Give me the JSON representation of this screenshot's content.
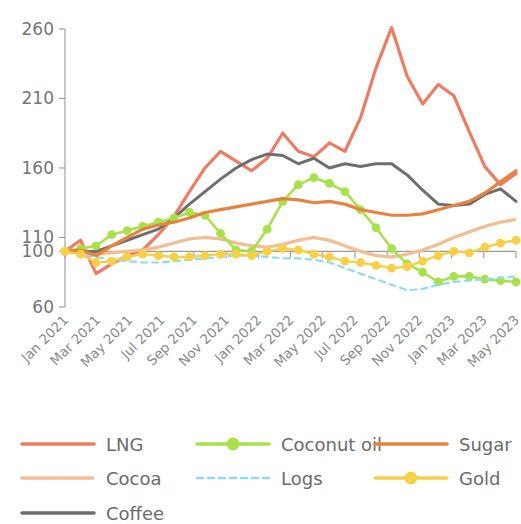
{
  "chart_data": {
    "type": "line",
    "title": "",
    "subtitle": "",
    "xlabel": "",
    "ylabel": "",
    "ylim": [
      60,
      265
    ],
    "ytick_values": [
      60,
      100,
      110,
      160,
      210,
      260
    ],
    "ytick_labels": [
      "60",
      "100",
      "110",
      "160",
      "210",
      "260"
    ],
    "grid": false,
    "legend_position": "bottom",
    "baseline": 100,
    "x": [
      "Jan 2021",
      "Feb 2021",
      "Mar 2021",
      "Apr 2021",
      "May 2021",
      "Jun 2021",
      "Jul 2021",
      "Aug 2021",
      "Sep 2021",
      "Oct 2021",
      "Nov 2021",
      "Dec 2021",
      "Jan 2022",
      "Feb 2022",
      "Mar 2022",
      "Apr 2022",
      "May 2022",
      "Jun 2022",
      "Jul 2022",
      "Aug 2022",
      "Sep 2022",
      "Oct 2022",
      "Nov 2022",
      "Dec 2022",
      "Jan 2023",
      "Feb 2023",
      "Mar 2023",
      "Apr 2023",
      "May 2023",
      "Jun 2023"
    ],
    "xtick_labels": [
      "Jan 2021",
      "Mar 2021",
      "May 2021",
      "Jul 2021",
      "Sep 2021",
      "Nov 2021",
      "Jan 2022",
      "Mar 2022",
      "May 2022",
      "Jul 2022",
      "Sep 2022",
      "Nov 2022",
      "Jan 2023",
      "Mar 2023",
      "May 2023"
    ],
    "series": [
      {
        "name": "LNG",
        "color": "#EE7C62",
        "style": "solid",
        "markers": false,
        "width": 3.2,
        "values": [
          100,
          108,
          84,
          91,
          97,
          101,
          112,
          125,
          143,
          160,
          172,
          165,
          158,
          167,
          185,
          172,
          168,
          178,
          172,
          196,
          232,
          261,
          226,
          206,
          220,
          212,
          186,
          161,
          148,
          156
        ]
      },
      {
        "name": "Cocoa",
        "color": "#F3BE92",
        "style": "dotted",
        "markers": false,
        "width": 3.4,
        "values": [
          100,
          99,
          98,
          99,
          100,
          101,
          103,
          106,
          109,
          110,
          109,
          106,
          104,
          103,
          105,
          108,
          110,
          108,
          104,
          100,
          97,
          96,
          98,
          101,
          105,
          110,
          114,
          118,
          121,
          123
        ]
      },
      {
        "name": "Coffee",
        "color": "#6E6E6E",
        "style": "solid",
        "markers": false,
        "width": 3.0,
        "values": [
          100,
          100,
          100,
          104,
          108,
          112,
          116,
          124,
          134,
          143,
          152,
          160,
          166,
          170,
          169,
          163,
          167,
          160,
          163,
          161,
          163,
          163,
          155,
          144,
          134,
          133,
          134,
          141,
          145,
          136
        ]
      },
      {
        "name": "Coconut oil",
        "color": "#A8E24A",
        "style": "solid",
        "markers": true,
        "width": 2.6,
        "values": [
          100,
          102,
          104,
          112,
          115,
          118,
          121,
          124,
          128,
          126,
          113,
          101,
          100,
          116,
          136,
          148,
          153,
          149,
          143,
          130,
          117,
          102,
          91,
          85,
          78,
          82,
          82,
          80,
          79,
          78
        ]
      },
      {
        "name": "Logs",
        "color": "#8FDDEC",
        "style": "dashed",
        "markers": false,
        "width": 2.2,
        "values": [
          100,
          98,
          96,
          94,
          93,
          92,
          92,
          93,
          94,
          95,
          96,
          97,
          97,
          96,
          95,
          95,
          94,
          92,
          88,
          84,
          80,
          76,
          72,
          73,
          76,
          78,
          79,
          80,
          81,
          82
        ]
      },
      {
        "name": "Sugar",
        "color": "#E8833F",
        "style": "solid",
        "markers": false,
        "width": 3.2,
        "values": [
          100,
          101,
          97,
          104,
          110,
          116,
          119,
          121,
          124,
          128,
          130,
          132,
          134,
          136,
          138,
          137,
          135,
          136,
          134,
          130,
          128,
          126,
          126,
          127,
          130,
          133,
          136,
          142,
          150,
          158
        ]
      },
      {
        "name": "Gold",
        "color": "#F7D046",
        "style": "solid",
        "markers": true,
        "width": 2.4,
        "values": [
          100,
          98,
          92,
          93,
          96,
          98,
          97,
          96,
          96,
          97,
          98,
          98,
          97,
          100,
          102,
          101,
          98,
          96,
          93,
          92,
          90,
          88,
          89,
          93,
          97,
          100,
          99,
          103,
          106,
          108
        ]
      }
    ]
  },
  "legend": {
    "items": [
      {
        "label": "LNG",
        "color": "#EE7C62",
        "style": "solid",
        "marker": false,
        "col": 0,
        "row": 0
      },
      {
        "label": "Cocoa",
        "color": "#F3BE92",
        "style": "dotted",
        "marker": false,
        "col": 0,
        "row": 1
      },
      {
        "label": "Coffee",
        "color": "#6E6E6E",
        "style": "solid",
        "marker": false,
        "col": 0,
        "row": 2
      },
      {
        "label": "Coconut oil",
        "color": "#A8E24A",
        "style": "solid",
        "marker": true,
        "col": 1,
        "row": 0
      },
      {
        "label": "Logs",
        "color": "#8FDDEC",
        "style": "dashed",
        "marker": false,
        "col": 1,
        "row": 1
      },
      {
        "label": "Sugar",
        "color": "#E8833F",
        "style": "solid",
        "marker": false,
        "col": 2,
        "row": 0
      },
      {
        "label": "Gold",
        "color": "#F7D046",
        "style": "solid",
        "marker": true,
        "col": 2,
        "row": 1
      }
    ]
  },
  "colors": {
    "axis": "#9a9a9a",
    "ytick_text": "#757575",
    "xtick_text": "#8a8a8a",
    "legend_text": "#6b6b6b",
    "background": "#ffffff"
  }
}
